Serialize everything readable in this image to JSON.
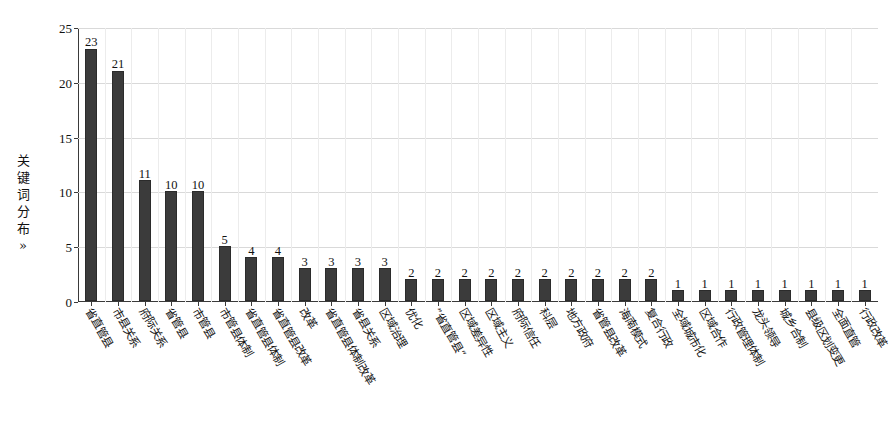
{
  "chart_data": {
    "type": "bar",
    "title": "",
    "subtitle": "",
    "xlabel": "",
    "ylabel": "关键词分布»",
    "ylim": [
      0,
      25
    ],
    "yticks": [
      0,
      5,
      10,
      15,
      20,
      25
    ],
    "ytick_labels": [
      "0",
      "5",
      "10",
      "15",
      "20",
      "25"
    ],
    "grid": true,
    "grid_axis": "both",
    "legend": false,
    "legend_position": "none",
    "bar_color": "#3b3b3b",
    "show_value_labels": true,
    "categories": [
      "省直管县",
      "市县关系",
      "府际关系",
      "省管县",
      "市管县",
      "市管县体制",
      "省直管县体制",
      "省直管县改革",
      "改革",
      "省直管县体制改革",
      "省县关系",
      "区域治理",
      "优化",
      "“省直管县”",
      "区域差异性",
      "区域主义",
      "府际信任",
      "科层",
      "地方政府",
      "省管县改革",
      "海南模式",
      "复合行政",
      "全域城市化",
      "区域合作",
      "行政管理体制",
      "龙头领导",
      "城乡合制",
      "县级区划变更",
      "全面直管",
      "行政改革"
    ],
    "values": [
      23,
      21,
      11,
      10,
      10,
      5,
      4,
      4,
      3,
      3,
      3,
      3,
      2,
      2,
      2,
      2,
      2,
      2,
      2,
      2,
      2,
      2,
      1,
      1,
      1,
      1,
      1,
      1,
      1,
      1
    ]
  },
  "axis": {
    "y_title": "关键词分布»",
    "y_title_chars": [
      "关",
      "键",
      "词",
      "分",
      "布",
      "»"
    ]
  }
}
